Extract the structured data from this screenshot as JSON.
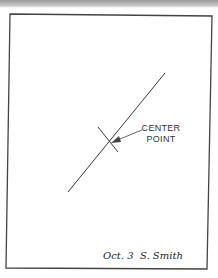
{
  "diagram": {
    "labels": {
      "center_line1": "CENTER",
      "center_line2": "POINT"
    },
    "annotation": {
      "date": "Oct. 3",
      "signature": "S. Smith"
    },
    "geometry": {
      "frame": [
        [
          10,
          14
        ],
        [
          212,
          16
        ],
        [
          207,
          269
        ],
        [
          6,
          268
        ]
      ],
      "main_line": {
        "x1": 165,
        "y1": 73,
        "x2": 68,
        "y2": 192
      },
      "cross_tick": {
        "x1": 98,
        "y1": 127,
        "x2": 118,
        "y2": 152
      },
      "center_point": {
        "x": 109,
        "y": 143
      },
      "arrow": {
        "x1": 142,
        "y1": 130,
        "x2": 112,
        "y2": 143
      }
    },
    "colors": {
      "ink": "#333333",
      "frame": "#444444",
      "top_bar": "#a8a8a8"
    }
  }
}
